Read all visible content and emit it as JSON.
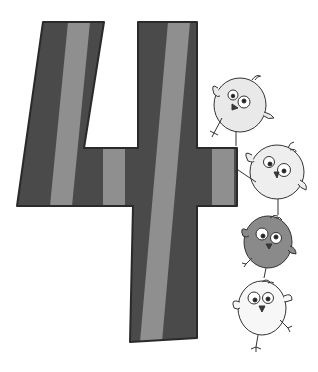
{
  "illustration": {
    "subject": "number-four-with-birds",
    "numeral": "4",
    "colors": {
      "background": "#ffffff",
      "stripe_dark": "#4a4a4a",
      "stripe_light": "#8f8f8f",
      "outline": "#2a2a2a",
      "bird_light": "#e9e9e9",
      "bird_white": "#f7f7f7",
      "bird_dark": "#8a8a8a",
      "beak": "#3a3a3a"
    },
    "birds": [
      {
        "id": "bird-top",
        "shade": "light"
      },
      {
        "id": "bird-second",
        "shade": "light"
      },
      {
        "id": "bird-third",
        "shade": "dark"
      },
      {
        "id": "bird-bottom",
        "shade": "white"
      }
    ]
  }
}
